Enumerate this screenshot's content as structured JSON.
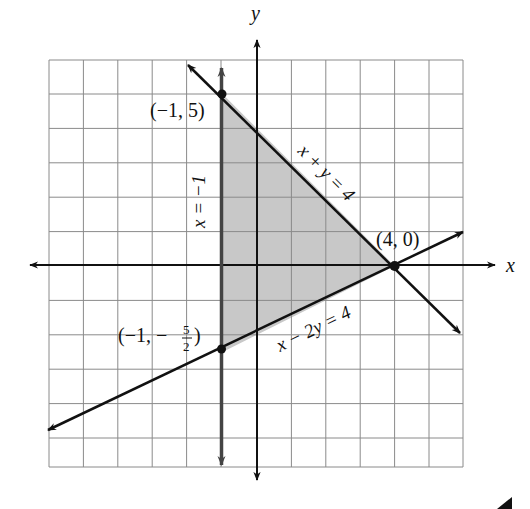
{
  "diagram": {
    "type": "system-of-linear-inequalities-graph",
    "axes": {
      "x_label": "x",
      "y_label": "y",
      "x_range": [
        -6,
        6
      ],
      "y_range": [
        -6,
        6
      ],
      "grid": true
    },
    "lines": [
      {
        "equation": "x + y = 4",
        "label": "x + y = 4"
      },
      {
        "equation": "x = -1",
        "label": "x = −1"
      },
      {
        "equation": "x - 2y = 4",
        "label": "x − 2y = 4"
      }
    ],
    "vertices": [
      {
        "x": -1,
        "y": 5,
        "label": "(−1, 5)"
      },
      {
        "x": 4,
        "y": 0,
        "label": "(4, 0)"
      },
      {
        "x": -1,
        "y": -2.5,
        "label_prefix": "(−1, −",
        "label_num": "5",
        "label_den": "2",
        "label_suffix": ")"
      }
    ],
    "shaded_region": "triangle with vertices (−1, 5), (4, 0), (−1, −5/2)",
    "colors": {
      "shade": "#c8c8c8",
      "grid": "#8a8a8a",
      "line": "#111111"
    }
  }
}
